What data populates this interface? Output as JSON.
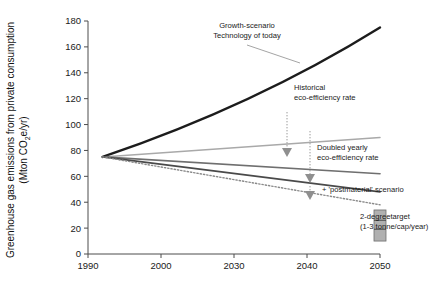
{
  "chart_data": {
    "type": "line",
    "title": "",
    "xlabel": "",
    "ylabel": "Greenhouse gas emissions from private consumption (Mton CO2e/yr)",
    "ylabel_line1": "Greenhouse gas emissions from private consumption",
    "ylabel_line2": "(Mton CO",
    "ylabel_sub": "2",
    "ylabel_line2b": "e/yr)",
    "xlim": [
      1990,
      2050
    ],
    "ylim": [
      0,
      180
    ],
    "grid": false,
    "legend_position": "inline-annotations",
    "xticks": [
      1990,
      2000,
      2030,
      2040,
      2050
    ],
    "xtick_labels": [
      "1990",
      "2000",
      "2030",
      "2040",
      "2050"
    ],
    "yticks": [
      0,
      20,
      40,
      60,
      80,
      100,
      120,
      140,
      160,
      180
    ],
    "ytick_labels": [
      "0",
      "20",
      "40",
      "60",
      "80",
      "100",
      "120",
      "140",
      "160",
      "180"
    ],
    "x": [
      1992,
      2050
    ],
    "series": [
      {
        "name": "Growth-scenario Technology of today",
        "values": [
          75,
          175
        ],
        "color": "#1c1c1c",
        "width": 2.4,
        "style": "solid"
      },
      {
        "name": "Historical eco-efficiency rate",
        "values": [
          75,
          90
        ],
        "color": "#a9a9a9",
        "width": 1.5,
        "style": "solid"
      },
      {
        "name": "Doubled yearly eco-efficiency rate",
        "values": [
          75,
          62
        ],
        "color": "#6f6f6f",
        "width": 1.7,
        "style": "solid"
      },
      {
        "name": "+ 'postmaterial' scenario",
        "values": [
          75,
          48
        ],
        "color": "#4a4a4a",
        "width": 1.7,
        "style": "solid"
      },
      {
        "name": "dotted lower bound",
        "values": [
          75,
          38
        ],
        "color": "#8a8a8a",
        "width": 1.4,
        "style": "dotted"
      }
    ],
    "target_band": {
      "label_line1": "2-degreetarget",
      "label_line2": "(1-3 tonne/cap/year)",
      "x": 2050,
      "ymin": 10,
      "ymax": 34,
      "color": "#b0b0b0"
    },
    "annotations": [
      {
        "name": "growth-scenario",
        "line1": "Growth-scenario",
        "line2": "Technology of today"
      },
      {
        "name": "historical-eco-efficiency",
        "line1": "Historical",
        "line2": "eco-efficiency rate"
      },
      {
        "name": "doubled-eco-efficiency",
        "line1": "Doubled yearly",
        "line2": "eco-efficiency rate"
      },
      {
        "name": "postmaterial",
        "line1": "+ 'postmaterial' scenario",
        "line2": ""
      }
    ]
  }
}
